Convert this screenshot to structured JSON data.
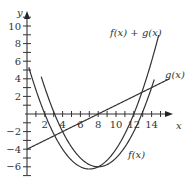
{
  "chart_data": {
    "type": "line",
    "title": "",
    "xlabel": "x",
    "ylabel": "y",
    "xlim": [
      0,
      15.5
    ],
    "ylim": [
      -7,
      11
    ],
    "x_ticks": [
      2,
      4,
      6,
      8,
      10,
      12,
      14
    ],
    "y_ticks": [
      -6,
      -4,
      -2,
      2,
      4,
      6,
      8,
      10
    ],
    "grid": false,
    "series": [
      {
        "name": "f(x)",
        "formula": "0.25*(x-8)^2 - 6",
        "x_range": [
          1.6,
          14.3
        ]
      },
      {
        "name": "g(x)",
        "formula": "0.5*x - 4",
        "x_range": [
          0,
          16
        ]
      },
      {
        "name": "f(x) + g(x)",
        "formula": "0.25*x^2 - 3.5*x + 6",
        "x_range": [
          0.2,
          14.8
        ]
      }
    ],
    "annotations": [
      {
        "text": "f(x) + g(x)",
        "x": 10,
        "y": 9
      },
      {
        "text": "g(x)",
        "x": 15.2,
        "y": 4.2
      },
      {
        "text": "f(x)",
        "x": 11.5,
        "y": -4
      }
    ]
  },
  "labels": {
    "x_axis": "x",
    "y_axis": "y",
    "f": "f(x)",
    "g": "g(x)",
    "fg": "f(x) + g(x)"
  }
}
